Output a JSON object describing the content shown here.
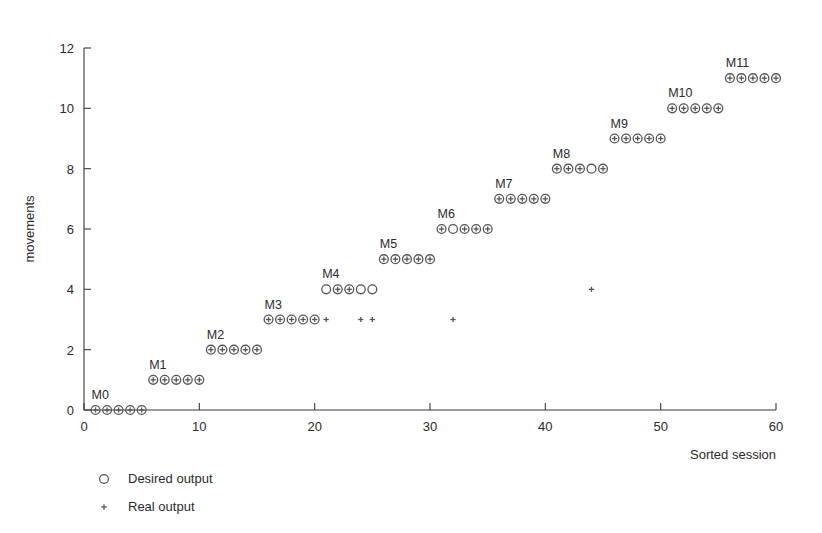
{
  "chart_data": {
    "type": "scatter",
    "title": "",
    "xlabel": "Sorted session",
    "ylabel": "movements",
    "xlim": [
      0,
      60
    ],
    "ylim": [
      0,
      12
    ],
    "xticks": [
      0,
      10,
      20,
      30,
      40,
      50,
      60
    ],
    "yticks": [
      0,
      2,
      4,
      6,
      8,
      10,
      12
    ],
    "grid": false,
    "legend_position": "below-left",
    "legend": [
      {
        "key": "desired",
        "marker": "circle",
        "label": "Desired output"
      },
      {
        "key": "real",
        "marker": "plus",
        "label": "Real output"
      }
    ],
    "group_annotations": [
      {
        "label": "M0",
        "x": 1,
        "y": 0
      },
      {
        "label": "M1",
        "x": 6,
        "y": 1
      },
      {
        "label": "M2",
        "x": 11,
        "y": 2
      },
      {
        "label": "M3",
        "x": 16,
        "y": 3
      },
      {
        "label": "M4",
        "x": 21,
        "y": 4
      },
      {
        "label": "M5",
        "x": 26,
        "y": 5
      },
      {
        "label": "M6",
        "x": 31,
        "y": 6
      },
      {
        "label": "M7",
        "x": 36,
        "y": 7
      },
      {
        "label": "M8",
        "x": 41,
        "y": 8
      },
      {
        "label": "M9",
        "x": 46,
        "y": 9
      },
      {
        "label": "M10",
        "x": 51,
        "y": 10
      },
      {
        "label": "M11",
        "x": 56,
        "y": 11
      }
    ],
    "series": [
      {
        "name": "Desired output",
        "marker": "circle",
        "x": [
          1,
          2,
          3,
          4,
          5,
          6,
          7,
          8,
          9,
          10,
          11,
          12,
          13,
          14,
          15,
          16,
          17,
          18,
          19,
          20,
          21,
          22,
          23,
          24,
          25,
          26,
          27,
          28,
          29,
          30,
          31,
          32,
          33,
          34,
          35,
          36,
          37,
          38,
          39,
          40,
          41,
          42,
          43,
          44,
          45,
          46,
          47,
          48,
          49,
          50,
          51,
          52,
          53,
          54,
          55,
          56,
          57,
          58,
          59,
          60
        ],
        "y": [
          0,
          0,
          0,
          0,
          0,
          1,
          1,
          1,
          1,
          1,
          2,
          2,
          2,
          2,
          2,
          3,
          3,
          3,
          3,
          3,
          4,
          4,
          4,
          4,
          4,
          5,
          5,
          5,
          5,
          5,
          6,
          6,
          6,
          6,
          6,
          7,
          7,
          7,
          7,
          7,
          8,
          8,
          8,
          8,
          8,
          9,
          9,
          9,
          9,
          9,
          10,
          10,
          10,
          10,
          10,
          11,
          11,
          11,
          11,
          11
        ]
      },
      {
        "name": "Real output",
        "marker": "plus",
        "x": [
          1,
          2,
          3,
          4,
          5,
          6,
          7,
          8,
          9,
          10,
          11,
          12,
          13,
          14,
          15,
          16,
          17,
          18,
          19,
          20,
          21,
          22,
          23,
          24,
          25,
          26,
          27,
          28,
          29,
          30,
          31,
          32,
          33,
          34,
          35,
          36,
          37,
          38,
          39,
          40,
          41,
          42,
          43,
          44,
          45,
          46,
          47,
          48,
          49,
          50,
          51,
          52,
          53,
          54,
          55,
          56,
          57,
          58,
          59,
          60
        ],
        "y": [
          0,
          0,
          0,
          0,
          0,
          1,
          1,
          1,
          1,
          1,
          2,
          2,
          2,
          2,
          2,
          3,
          3,
          3,
          3,
          3,
          3,
          4,
          4,
          3,
          3,
          5,
          5,
          5,
          5,
          5,
          6,
          3,
          6,
          6,
          6,
          7,
          7,
          7,
          7,
          7,
          8,
          8,
          8,
          4,
          8,
          9,
          9,
          9,
          9,
          9,
          10,
          10,
          10,
          10,
          10,
          11,
          11,
          11,
          11,
          11
        ]
      }
    ]
  }
}
